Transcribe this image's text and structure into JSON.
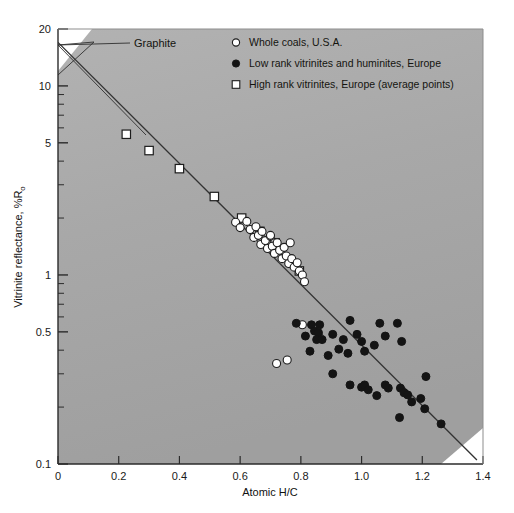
{
  "figure": {
    "title": "",
    "background_color": "#ffffff",
    "plot_background_color": "#a9a9a9"
  },
  "annotations": [
    {
      "name": "graphite",
      "label": "Graphite",
      "x": 0.0,
      "y": 17.0
    }
  ],
  "legend": {
    "position": "top-right-inside",
    "entries": [
      {
        "marker": "open-circle",
        "label": "Whole coals, U.S.A."
      },
      {
        "marker": "filled-circle",
        "label": "Low rank vitrinites and huminites, Europe"
      },
      {
        "marker": "open-square",
        "label": "High rank vitrinites, Europe (average points)"
      }
    ]
  },
  "chart_data": {
    "type": "scatter",
    "title": "",
    "xlabel": "Atomic H/C",
    "ylabel": "Vitrinite reflectance, %Ro",
    "ylabel_base": "Vitrinite reflectance, %R",
    "ylabel_subscript": "o",
    "xscale": "linear",
    "yscale": "log",
    "xlim": [
      0,
      1.4
    ],
    "ylim": [
      0.1,
      20
    ],
    "grid": false,
    "xticks": [
      0,
      0.2,
      0.4,
      0.6,
      0.8,
      1.0,
      1.2,
      1.4
    ],
    "xticklabels": [
      "0",
      "0.2",
      "0.4",
      "0.6",
      "0.8",
      "1.0",
      "1.2",
      "1.4"
    ],
    "yticks": [
      0.1,
      0.5,
      1,
      5,
      10,
      20
    ],
    "yticklabels": [
      "0.1",
      "0.5",
      "1",
      "5",
      "10",
      "20"
    ],
    "yminorticks": [
      0.2,
      0.3,
      0.4,
      0.6,
      0.7,
      0.8,
      0.9,
      2,
      3,
      4,
      6,
      7,
      8,
      9
    ],
    "trendline": {
      "name": "coalification-trend",
      "x_start": 0.0,
      "y_start": 17.0,
      "x_end": 1.38,
      "y_end": 0.105,
      "color": "#333333"
    },
    "series": [
      {
        "name": "High rank vitrinites, Europe (average points)",
        "marker": "open-square",
        "points": [
          [
            0.225,
            5.55
          ],
          [
            0.3,
            4.55
          ],
          [
            0.4,
            3.65
          ],
          [
            0.515,
            2.6
          ],
          [
            0.605,
            2.0
          ],
          [
            0.665,
            1.7
          ],
          [
            0.715,
            1.48
          ],
          [
            0.795,
            1.05
          ]
        ]
      },
      {
        "name": "Whole coals, U.S.A.",
        "marker": "open-circle",
        "points": [
          [
            0.585,
            1.9
          ],
          [
            0.6,
            1.78
          ],
          [
            0.622,
            1.92
          ],
          [
            0.633,
            1.74
          ],
          [
            0.645,
            1.58
          ],
          [
            0.652,
            1.8
          ],
          [
            0.66,
            1.62
          ],
          [
            0.668,
            1.45
          ],
          [
            0.672,
            1.7
          ],
          [
            0.683,
            1.52
          ],
          [
            0.69,
            1.38
          ],
          [
            0.7,
            1.6
          ],
          [
            0.706,
            1.42
          ],
          [
            0.713,
            1.3
          ],
          [
            0.722,
            1.48
          ],
          [
            0.73,
            1.35
          ],
          [
            0.738,
            1.22
          ],
          [
            0.745,
            1.4
          ],
          [
            0.752,
            1.26
          ],
          [
            0.76,
            1.15
          ],
          [
            0.77,
            1.22
          ],
          [
            0.778,
            1.1
          ],
          [
            0.788,
            1.16
          ],
          [
            0.795,
            1.05
          ],
          [
            0.805,
            1.0
          ],
          [
            0.7,
            1.62
          ],
          [
            0.765,
            1.48
          ],
          [
            0.812,
            0.92
          ],
          [
            0.72,
            0.34
          ],
          [
            0.805,
            0.545
          ],
          [
            0.85,
            0.525
          ],
          [
            0.862,
            0.465
          ],
          [
            0.755,
            0.355
          ]
        ]
      },
      {
        "name": "Low rank vitrinites and huminites, Europe",
        "marker": "filled-circle",
        "points": [
          [
            0.785,
            0.555
          ],
          [
            0.835,
            0.545
          ],
          [
            0.845,
            0.505
          ],
          [
            0.858,
            0.495
          ],
          [
            0.852,
            0.455
          ],
          [
            0.87,
            0.455
          ],
          [
            0.905,
            0.485
          ],
          [
            0.83,
            0.395
          ],
          [
            0.89,
            0.375
          ],
          [
            0.925,
            0.405
          ],
          [
            0.94,
            0.455
          ],
          [
            0.962,
            0.575
          ],
          [
            0.985,
            0.485
          ],
          [
            1.0,
            0.445
          ],
          [
            1.01,
            0.395
          ],
          [
            1.042,
            0.425
          ],
          [
            1.06,
            0.555
          ],
          [
            1.078,
            0.475
          ],
          [
            1.118,
            0.555
          ],
          [
            1.132,
            0.445
          ],
          [
            0.955,
            0.385
          ],
          [
            0.905,
            0.3
          ],
          [
            0.962,
            0.262
          ],
          [
            1.0,
            0.255
          ],
          [
            1.01,
            0.262
          ],
          [
            1.022,
            0.247
          ],
          [
            1.05,
            0.23
          ],
          [
            1.088,
            0.252
          ],
          [
            1.128,
            0.252
          ],
          [
            1.14,
            0.238
          ],
          [
            1.152,
            0.232
          ],
          [
            1.165,
            0.213
          ],
          [
            1.195,
            0.222
          ],
          [
            1.208,
            0.196
          ],
          [
            1.125,
            0.176
          ],
          [
            1.262,
            0.163
          ],
          [
            1.212,
            0.29
          ],
          [
            1.078,
            0.262
          ],
          [
            0.862,
            0.545
          ],
          [
            0.815,
            0.475
          ]
        ]
      }
    ]
  }
}
